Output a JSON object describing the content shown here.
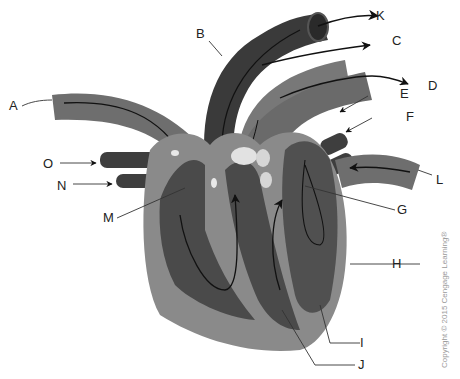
{
  "figure": {
    "copyright": "Copyright © 2015 Cengage Learning®"
  },
  "labels": [
    {
      "id": "A",
      "text": "A"
    },
    {
      "id": "B",
      "text": "B"
    },
    {
      "id": "C",
      "text": "C"
    },
    {
      "id": "D",
      "text": "D"
    },
    {
      "id": "E",
      "text": "E"
    },
    {
      "id": "F",
      "text": "F"
    },
    {
      "id": "G",
      "text": "G"
    },
    {
      "id": "H",
      "text": "H"
    },
    {
      "id": "I",
      "text": "I"
    },
    {
      "id": "J",
      "text": "J"
    },
    {
      "id": "K",
      "text": "K"
    },
    {
      "id": "L",
      "text": "L"
    },
    {
      "id": "M",
      "text": "M"
    },
    {
      "id": "N",
      "text": "N"
    },
    {
      "id": "O",
      "text": "O"
    }
  ],
  "colors": {
    "dark_vessel": "#3c3c3c",
    "mid_vessel": "#6e6e6e",
    "wall": "#8a8a8a",
    "chamber": "#4a4a4a",
    "valve": "#e2e2e2",
    "line": "#111111"
  }
}
